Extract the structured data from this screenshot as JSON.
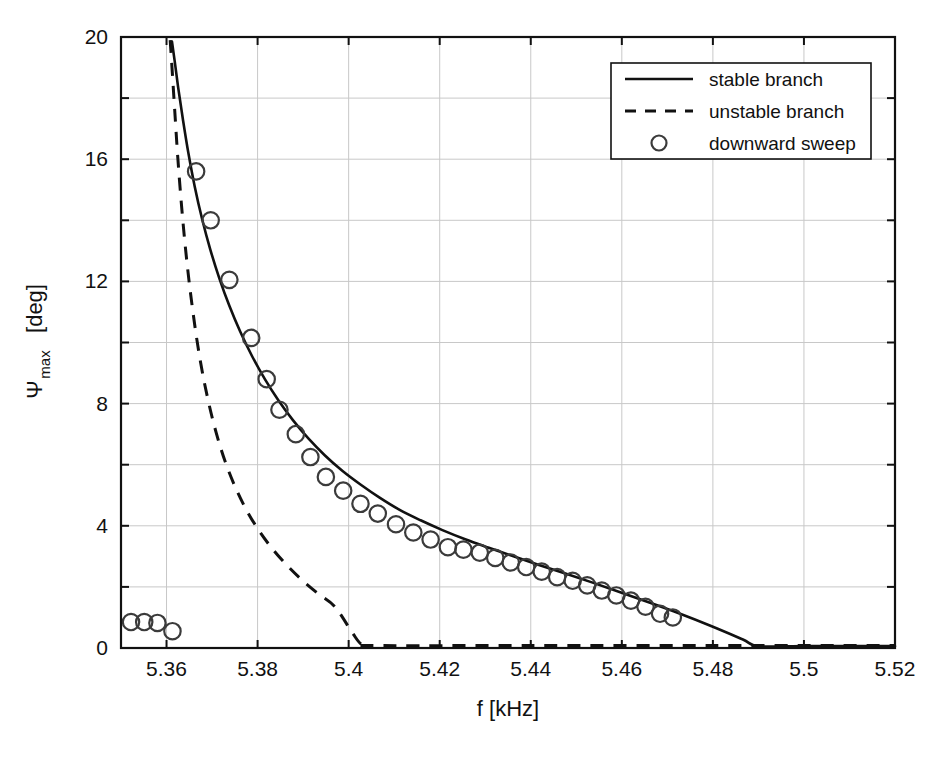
{
  "figure": {
    "kind": "scan-of-printed-figure",
    "background_color": "#ffffff",
    "ink_color": "#111111",
    "grid_color": "#c8c8c8"
  },
  "chart_data": {
    "type": "line",
    "title": "",
    "xlabel": "f [kHz]",
    "ylabel_main": "Ψ",
    "ylabel_sub": "max",
    "ylabel_unit": " [deg]",
    "ylabel_full": "Ψmax [deg]",
    "xlim": [
      5.35,
      5.52
    ],
    "ylim": [
      0,
      20
    ],
    "grid": true,
    "xticks": [
      5.36,
      5.38,
      5.4,
      5.42,
      5.44,
      5.46,
      5.48,
      5.5,
      5.52
    ],
    "xtick_labels": [
      "5.36",
      "5.38",
      "5.4",
      "5.42",
      "5.44",
      "5.46",
      "5.48",
      "5.5",
      "5.52"
    ],
    "yticks": [
      0,
      2,
      4,
      6,
      8,
      10,
      12,
      14,
      16,
      18,
      20
    ],
    "ytick_labels": [
      "0",
      "2",
      "4",
      "6",
      "8",
      "10",
      "12",
      "14",
      "16",
      "18",
      "20"
    ],
    "legend_position": "top-right",
    "legend": [
      {
        "label": "stable branch",
        "style": "solid-line"
      },
      {
        "label": "unstable branch",
        "style": "dashed-line"
      },
      {
        "label": "downward sweep",
        "style": "open-circle-marker"
      }
    ],
    "series": [
      {
        "name": "stable branch",
        "style": "solid-line",
        "x": [
          5.3612,
          5.3618,
          5.3626,
          5.3636,
          5.3648,
          5.3662,
          5.3678,
          5.3696,
          5.3716,
          5.3738,
          5.3762,
          5.3788,
          5.3816,
          5.3846,
          5.3878,
          5.3912,
          5.3948,
          5.3986,
          5.4026,
          5.4068,
          5.4112,
          5.4158,
          5.4206,
          5.4256,
          5.4308,
          5.4362,
          5.4418,
          5.4476,
          5.4536,
          5.4598,
          5.4662,
          5.4728,
          5.4796,
          5.4866,
          5.49,
          5.5,
          5.51,
          5.52
        ],
        "y": [
          19.85,
          19.2,
          18.3,
          17.3,
          16.2,
          15.1,
          14.05,
          13.05,
          12.1,
          11.2,
          10.35,
          9.55,
          8.8,
          8.1,
          7.45,
          6.85,
          6.3,
          5.8,
          5.35,
          4.92,
          4.52,
          4.18,
          3.86,
          3.56,
          3.28,
          3.0,
          2.72,
          2.44,
          2.14,
          1.82,
          1.48,
          1.12,
          0.72,
          0.28,
          0.06,
          0.06,
          0.06,
          0.06
        ]
      },
      {
        "name": "unstable branch",
        "style": "dashed-line",
        "x": [
          5.3608,
          5.3612,
          5.3618,
          5.3625,
          5.3634,
          5.3645,
          5.3658,
          5.3673,
          5.369,
          5.3709,
          5.373,
          5.3753,
          5.3778,
          5.3805,
          5.3834,
          5.3865,
          5.3898,
          5.3933,
          5.397,
          5.4008,
          5.4028,
          5.405,
          5.44,
          5.48,
          5.52
        ],
        "y": [
          19.9,
          19.0,
          17.6,
          16.0,
          14.3,
          12.6,
          11.0,
          9.5,
          8.2,
          7.05,
          6.05,
          5.2,
          4.45,
          3.8,
          3.22,
          2.7,
          2.22,
          1.78,
          1.35,
          0.5,
          0.12,
          0.08,
          0.08,
          0.08,
          0.08
        ]
      }
    ],
    "markers": {
      "name": "downward sweep",
      "style": "open-circle-marker",
      "points": [
        {
          "x": 5.3522,
          "y": 0.85
        },
        {
          "x": 5.3551,
          "y": 0.85
        },
        {
          "x": 5.358,
          "y": 0.82
        },
        {
          "x": 5.3613,
          "y": 0.55
        },
        {
          "x": 5.3665,
          "y": 15.6
        },
        {
          "x": 5.3697,
          "y": 14.0
        },
        {
          "x": 5.3738,
          "y": 12.05
        },
        {
          "x": 5.3786,
          "y": 10.15
        },
        {
          "x": 5.382,
          "y": 8.8
        },
        {
          "x": 5.3848,
          "y": 7.8
        },
        {
          "x": 5.3884,
          "y": 7.0
        },
        {
          "x": 5.3916,
          "y": 6.25
        },
        {
          "x": 5.395,
          "y": 5.6
        },
        {
          "x": 5.3988,
          "y": 5.15
        },
        {
          "x": 5.4026,
          "y": 4.72
        },
        {
          "x": 5.4064,
          "y": 4.4
        },
        {
          "x": 5.4104,
          "y": 4.05
        },
        {
          "x": 5.4142,
          "y": 3.78
        },
        {
          "x": 5.418,
          "y": 3.55
        },
        {
          "x": 5.4218,
          "y": 3.3
        },
        {
          "x": 5.4252,
          "y": 3.22
        },
        {
          "x": 5.4288,
          "y": 3.12
        },
        {
          "x": 5.4322,
          "y": 2.95
        },
        {
          "x": 5.4356,
          "y": 2.8
        },
        {
          "x": 5.439,
          "y": 2.65
        },
        {
          "x": 5.4424,
          "y": 2.5
        },
        {
          "x": 5.4458,
          "y": 2.32
        },
        {
          "x": 5.4492,
          "y": 2.2
        },
        {
          "x": 5.4524,
          "y": 2.05
        },
        {
          "x": 5.4556,
          "y": 1.88
        },
        {
          "x": 5.4588,
          "y": 1.72
        },
        {
          "x": 5.462,
          "y": 1.55
        },
        {
          "x": 5.4652,
          "y": 1.35
        },
        {
          "x": 5.4684,
          "y": 1.12
        },
        {
          "x": 5.4712,
          "y": 1.0
        }
      ]
    }
  },
  "plot_geometry": {
    "left": 121,
    "right": 895,
    "top": 37,
    "bottom": 648
  },
  "legend_geometry": {
    "x": 611,
    "y": 63,
    "width": 260,
    "height": 96
  }
}
